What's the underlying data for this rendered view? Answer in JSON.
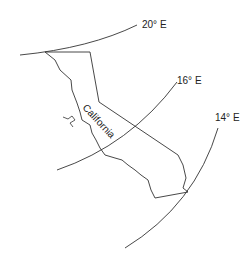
{
  "map": {
    "state_label": "California",
    "meridians": [
      {
        "label": "20° E"
      },
      {
        "label": "16° E"
      },
      {
        "label": "14° E"
      }
    ],
    "colors": {
      "line": "#333333",
      "text": "#222222",
      "background": "#ffffff"
    }
  }
}
